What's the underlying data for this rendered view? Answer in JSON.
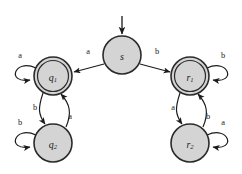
{
  "figure": {
    "kind": "finite-automaton-state-diagram",
    "background_color": "#ffffff",
    "stroke_color": "#1a1a1a",
    "state_fill_color": "#d4d4d4",
    "state_stroke_color": "#2b2b2b",
    "alphabet": [
      "a",
      "b"
    ],
    "start_state": "s",
    "accept_states": [
      "q1",
      "r1"
    ]
  },
  "states": [
    {
      "id": "s",
      "label_base": "s",
      "label_sub": "",
      "shape": "single-circle",
      "is_start": true,
      "is_accept": false,
      "cx": 122,
      "cy": 55,
      "r_outer": 19
    },
    {
      "id": "q1",
      "label_base": "q",
      "label_sub": "1",
      "shape": "double-circle",
      "is_start": false,
      "is_accept": true,
      "cx": 53,
      "cy": 76,
      "r_outer": 19,
      "r_inner": 15.5
    },
    {
      "id": "q2",
      "label_base": "q",
      "label_sub": "2",
      "shape": "single-circle",
      "is_start": false,
      "is_accept": false,
      "cx": 53,
      "cy": 143,
      "r_outer": 19
    },
    {
      "id": "r1",
      "label_base": "r",
      "label_sub": "1",
      "shape": "double-circle",
      "is_start": false,
      "is_accept": true,
      "cx": 190,
      "cy": 76,
      "r_outer": 19,
      "r_inner": 15.5
    },
    {
      "id": "r2",
      "label_base": "r",
      "label_sub": "2",
      "shape": "single-circle",
      "is_start": false,
      "is_accept": false,
      "cx": 190,
      "cy": 143,
      "r_outer": 19
    }
  ],
  "transitions": [
    {
      "id": "s-to-q1",
      "from": "s",
      "to": "q1",
      "symbol": "a",
      "label_x": 88,
      "label_y": 51
    },
    {
      "id": "s-to-r1",
      "from": "s",
      "to": "r1",
      "symbol": "b",
      "label_x": 157,
      "label_y": 51
    },
    {
      "id": "q1-self",
      "from": "q1",
      "to": "q1",
      "symbol": "a",
      "label_x": 20,
      "label_y": 55
    },
    {
      "id": "q1-to-q2",
      "from": "q1",
      "to": "q2",
      "symbol": "b",
      "label_x": 35,
      "label_y": 107
    },
    {
      "id": "q2-to-q1",
      "from": "q2",
      "to": "q1",
      "symbol": "a",
      "label_x": 70,
      "label_y": 116
    },
    {
      "id": "q2-self",
      "from": "q2",
      "to": "q2",
      "symbol": "b",
      "label_x": 20,
      "label_y": 122
    },
    {
      "id": "r1-self",
      "from": "r1",
      "to": "r1",
      "symbol": "b",
      "label_x": 223,
      "label_y": 55
    },
    {
      "id": "r1-to-r2",
      "from": "r1",
      "to": "r2",
      "symbol": "a",
      "label_x": 173,
      "label_y": 107
    },
    {
      "id": "r2-to-r1",
      "from": "r2",
      "to": "r1",
      "symbol": "b",
      "label_x": 208,
      "label_y": 116
    },
    {
      "id": "r2-self",
      "from": "r2",
      "to": "r2",
      "symbol": "a",
      "label_x": 223,
      "label_y": 122
    }
  ]
}
